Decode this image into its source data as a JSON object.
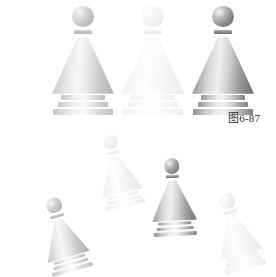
{
  "figure": {
    "caption": "图6-87",
    "caption_x": 228,
    "caption_y": 113,
    "background_color": "#ffffff",
    "width": 276,
    "height": 265,
    "description_icon": "chess-pawn-icon"
  },
  "pieces": [
    {
      "id": "pawn-large-1",
      "label": "大棋子一",
      "x": 52,
      "y": 6,
      "w": 62,
      "h": 98,
      "rotation": 0,
      "opacity": 0.52,
      "scale": 1,
      "role": "large-row"
    },
    {
      "id": "pawn-large-2",
      "label": "大棋子二",
      "x": 122,
      "y": 6,
      "w": 62,
      "h": 98,
      "rotation": 0,
      "opacity": 0.12,
      "scale": 1,
      "role": "large-row"
    },
    {
      "id": "pawn-large-3",
      "label": "大棋子三",
      "x": 192,
      "y": 6,
      "w": 62,
      "h": 98,
      "rotation": 0,
      "opacity": 1.0,
      "scale": 1,
      "role": "large-row"
    },
    {
      "id": "pawn-small-1",
      "label": "小棋子一",
      "x": 101,
      "y": 134,
      "w": 42,
      "h": 66,
      "rotation": -13,
      "opacity": 0.16,
      "scale": 1,
      "role": "scatter"
    },
    {
      "id": "pawn-small-2",
      "label": "小棋子二",
      "x": 152,
      "y": 158,
      "w": 45,
      "h": 70,
      "rotation": -3,
      "opacity": 0.95,
      "scale": 1,
      "role": "scatter"
    },
    {
      "id": "pawn-small-3",
      "label": "小棋子三",
      "x": 46,
      "y": 196,
      "w": 44,
      "h": 68,
      "rotation": -16,
      "opacity": 0.55,
      "scale": 1,
      "role": "scatter"
    },
    {
      "id": "pawn-small-4",
      "label": "小棋子四",
      "x": 219,
      "y": 192,
      "w": 44,
      "h": 70,
      "rotation": -15,
      "opacity": 0.14,
      "scale": 1,
      "role": "scatter"
    }
  ],
  "colors": {
    "page_background": "#ffffff",
    "caption_text": "#2b2b2b",
    "piece_light": "#f3f3f3",
    "piece_mid": "#a6a6a6",
    "piece_dark": "#6e6e6e"
  }
}
